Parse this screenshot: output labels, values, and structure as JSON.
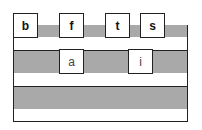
{
  "diagram": {
    "rows": [
      {
        "shade": "gray",
        "labels": [
          "b",
          "f",
          "t",
          "s"
        ]
      },
      {
        "shade": "white",
        "labels": []
      },
      {
        "shade": "gray",
        "labels": [
          "a",
          "i"
        ]
      },
      {
        "shade": "white",
        "labels": []
      },
      {
        "shade": "gray",
        "labels": []
      },
      {
        "shade": "white",
        "labels": []
      }
    ],
    "colors": {
      "gray_band": "#a9a9a9",
      "border": "#222222",
      "box_fill": "#ffffff"
    },
    "boxes": {
      "b": "b",
      "f": "f",
      "t": "t",
      "s": "s",
      "a": "a",
      "i": "i"
    }
  }
}
